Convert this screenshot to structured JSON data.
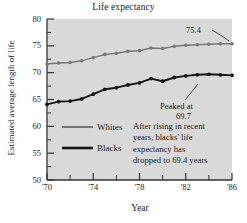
{
  "chart_data": {
    "type": "line",
    "title": "Life expectancy",
    "xlabel": "Year",
    "ylabel": "Estimated average length of life",
    "xlim": [
      1970,
      1986
    ],
    "ylim": [
      50,
      80
    ],
    "grid": false,
    "legend_position": "inside-lower-left",
    "y_ticks": [
      80,
      75,
      70,
      65,
      60,
      55,
      50
    ],
    "y_tick_labels": [
      "80",
      "75",
      "70",
      "65",
      "60",
      "55",
      "50"
    ],
    "y_minor_tick_step": 2.5,
    "x_ticks": [
      1970,
      1974,
      1978,
      1982,
      1986
    ],
    "x_tick_labels": [
      "'70",
      "'74",
      "'78",
      "'82",
      "'86"
    ],
    "x_minor_ticks": [
      1972,
      1976,
      1980,
      1984
    ],
    "x": [
      1970,
      1971,
      1972,
      1973,
      1974,
      1975,
      1976,
      1977,
      1978,
      1979,
      1980,
      1981,
      1982,
      1983,
      1984,
      1985,
      1986
    ],
    "series": [
      {
        "name": "Whites",
        "color": "#777777",
        "marker": "circle",
        "values": [
          71.6,
          71.8,
          71.9,
          72.2,
          72.8,
          73.4,
          73.6,
          74.0,
          74.1,
          74.6,
          74.5,
          74.9,
          75.1,
          75.2,
          75.3,
          75.4,
          75.4
        ]
      },
      {
        "name": "Blacks",
        "color": "#141414",
        "marker": "circle",
        "values": [
          64.1,
          64.6,
          64.7,
          65.1,
          66.0,
          66.9,
          67.2,
          67.7,
          68.1,
          68.9,
          68.4,
          69.1,
          69.4,
          69.6,
          69.7,
          69.6,
          69.5
        ]
      }
    ],
    "annotations": [
      {
        "id": "white-endpoint",
        "text": "75.4",
        "points_to_series": "Whites",
        "points_to_x": 1986,
        "points_to_value": 75.4
      },
      {
        "id": "black-peak",
        "line1": "Peaked at",
        "line2": "69.7",
        "points_to_series": "Blacks",
        "points_to_x": 1984,
        "points_to_value": 69.7
      }
    ],
    "note_lines": [
      "After rising in recent",
      "years, blacks' life",
      "expectancy has",
      "dropped to 69.4 years"
    ],
    "plot_background_color": "#d9d9d9",
    "axis_color": "#333333"
  }
}
